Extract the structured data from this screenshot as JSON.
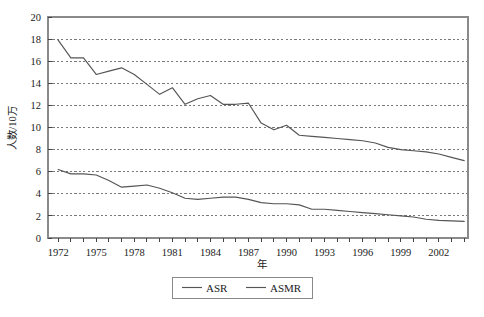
{
  "chart_data": {
    "type": "line",
    "title": "",
    "xlabel": "年",
    "ylabel": "人数/10万",
    "xlim": [
      1971.2,
      2004.3
    ],
    "ylim": [
      0,
      20
    ],
    "ytick_step": 2,
    "yticks": [
      "0",
      "2",
      "4",
      "6",
      "8",
      "10",
      "12",
      "14",
      "16",
      "18",
      "20"
    ],
    "xticks_major": [
      "1972",
      "1975",
      "1978",
      "1981",
      "1984",
      "1987",
      "1990",
      "1993",
      "1996",
      "1999",
      "2002"
    ],
    "xtick_minor_interval": 1,
    "grid": "horizontal-dotted",
    "legend_position": "below-center",
    "x": [
      1972,
      1973,
      1974,
      1975,
      1976,
      1977,
      1978,
      1979,
      1980,
      1981,
      1982,
      1983,
      1984,
      1985,
      1986,
      1987,
      1988,
      1989,
      1990,
      1991,
      1992,
      1993,
      1994,
      1995,
      1996,
      1997,
      1998,
      1999,
      2000,
      2001,
      2002,
      2003,
      2004
    ],
    "series": [
      {
        "name": "ASR",
        "color": "#555555",
        "values": [
          17.9,
          16.3,
          16.3,
          14.8,
          15.1,
          15.4,
          14.8,
          13.9,
          13.0,
          13.6,
          12.1,
          12.6,
          12.9,
          12.1,
          12.1,
          12.2,
          10.4,
          9.8,
          10.2,
          9.3,
          9.2,
          9.1,
          9.0,
          8.9,
          8.8,
          8.6,
          8.2,
          8.0,
          7.9,
          7.8,
          7.6,
          7.3,
          7.0
        ]
      },
      {
        "name": "ASMR",
        "color": "#555555",
        "values": [
          6.2,
          5.8,
          5.8,
          5.7,
          5.2,
          4.6,
          4.7,
          4.8,
          4.5,
          4.1,
          3.6,
          3.5,
          3.6,
          3.7,
          3.7,
          3.5,
          3.2,
          3.1,
          3.1,
          3.0,
          2.6,
          2.6,
          2.5,
          2.4,
          2.3,
          2.2,
          2.1,
          2.0,
          1.9,
          1.7,
          1.6,
          1.55,
          1.5
        ]
      }
    ],
    "legend": [
      {
        "label": "ASR",
        "color": "#555555"
      },
      {
        "label": "ASMR",
        "color": "#555555"
      }
    ],
    "frame": {
      "color": "#8a8a8a"
    },
    "gridline_color": "#7a7a7a"
  }
}
